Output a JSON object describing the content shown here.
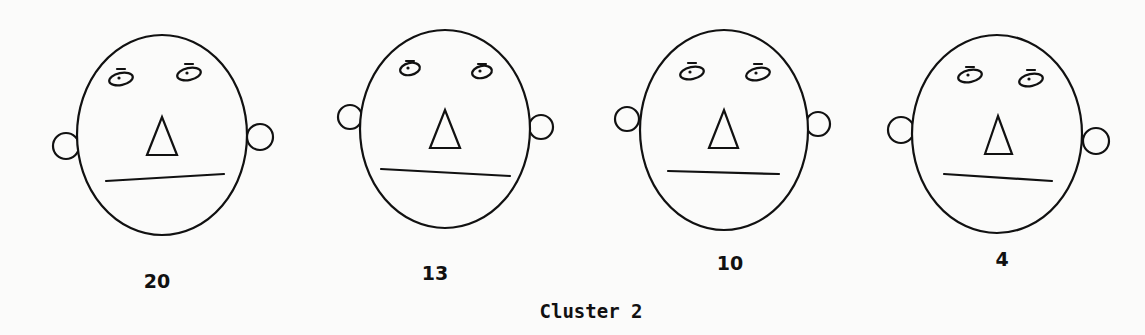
{
  "figure": {
    "caption": "Cluster 2",
    "stroke_color": "#111111",
    "background": "#fbfbfa",
    "faces": [
      {
        "label": "20",
        "label_pos": [
          157,
          270
        ],
        "head": {
          "cx": 162,
          "cy": 135,
          "rx": 85,
          "ry": 100
        },
        "ears": [
          {
            "cx": 66,
            "cy": 146,
            "r": 13
          },
          {
            "cx": 260,
            "cy": 137,
            "r": 13
          }
        ],
        "eyes": [
          {
            "cx": 121,
            "cy": 79,
            "rx": 12,
            "ry": 6,
            "brow_y": 69
          },
          {
            "cx": 189,
            "cy": 74,
            "rx": 12,
            "ry": 6,
            "brow_y": 64
          }
        ],
        "nose": [
          [
            147,
            155
          ],
          [
            162,
            117
          ],
          [
            177,
            155
          ]
        ],
        "mouth": [
          [
            106,
            181
          ],
          [
            224,
            174
          ]
        ]
      },
      {
        "label": "13",
        "label_pos": [
          435,
          262
        ],
        "head": {
          "cx": 445,
          "cy": 129,
          "rx": 85,
          "ry": 99
        },
        "ears": [
          {
            "cx": 350,
            "cy": 117,
            "r": 12
          },
          {
            "cx": 541,
            "cy": 127,
            "r": 12
          }
        ],
        "eyes": [
          {
            "cx": 410,
            "cy": 69,
            "rx": 10,
            "ry": 6,
            "brow_y": 61
          },
          {
            "cx": 482,
            "cy": 72,
            "rx": 10,
            "ry": 6,
            "brow_y": 64
          }
        ],
        "nose": [
          [
            430,
            148
          ],
          [
            445,
            110
          ],
          [
            460,
            148
          ]
        ],
        "mouth": [
          [
            381,
            169
          ],
          [
            510,
            176
          ]
        ]
      },
      {
        "label": "10",
        "label_pos": [
          730,
          252
        ],
        "head": {
          "cx": 724,
          "cy": 130,
          "rx": 84,
          "ry": 100
        },
        "ears": [
          {
            "cx": 627,
            "cy": 119,
            "r": 12
          },
          {
            "cx": 818,
            "cy": 124,
            "r": 12
          }
        ],
        "eyes": [
          {
            "cx": 692,
            "cy": 73,
            "rx": 12,
            "ry": 6,
            "brow_y": 63
          },
          {
            "cx": 758,
            "cy": 74,
            "rx": 12,
            "ry": 6,
            "brow_y": 64
          }
        ],
        "nose": [
          [
            709,
            148
          ],
          [
            724,
            110
          ],
          [
            738,
            148
          ]
        ],
        "mouth": [
          [
            668,
            171
          ],
          [
            779,
            174
          ]
        ]
      },
      {
        "label": "4",
        "label_pos": [
          1002,
          248
        ],
        "head": {
          "cx": 997,
          "cy": 134,
          "rx": 85,
          "ry": 99
        },
        "ears": [
          {
            "cx": 901,
            "cy": 130,
            "r": 13
          },
          {
            "cx": 1096,
            "cy": 141,
            "r": 13
          }
        ],
        "eyes": [
          {
            "cx": 970,
            "cy": 76,
            "rx": 12,
            "ry": 6,
            "brow_y": 67
          },
          {
            "cx": 1031,
            "cy": 80,
            "rx": 12,
            "ry": 6,
            "brow_y": 70
          }
        ],
        "nose": [
          [
            985,
            154
          ],
          [
            998,
            116
          ],
          [
            1012,
            154
          ]
        ],
        "mouth": [
          [
            944,
            174
          ],
          [
            1052,
            181
          ]
        ]
      }
    ]
  }
}
